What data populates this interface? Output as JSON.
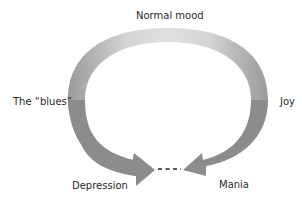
{
  "diagram": {
    "labels": {
      "top": "Normal mood",
      "left": "The “blues”",
      "right": "Joy",
      "bottom_left": "Depression",
      "bottom_right": "Mania"
    },
    "colors": {
      "arc_light": "#dcdcdc",
      "arc_dark": "#8a8a8a",
      "dash": "#222222",
      "text": "#2a2a2a"
    }
  }
}
